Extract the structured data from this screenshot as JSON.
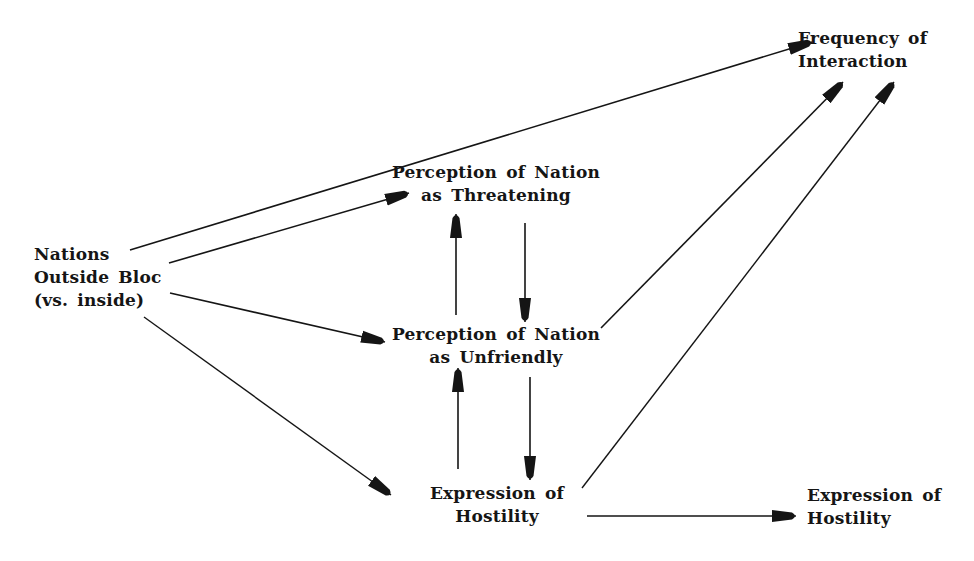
{
  "diagram": {
    "type": "causal-path-diagram",
    "nodes": [
      {
        "id": "nations_outside_bloc",
        "lines": [
          "Nations",
          "Outside Bloc",
          "(vs. inside)"
        ]
      },
      {
        "id": "perception_threatening",
        "lines": [
          "Perception of Nation",
          "as Threatening"
        ]
      },
      {
        "id": "perception_unfriendly",
        "lines": [
          "Perception of Nation",
          "as Unfriendly"
        ]
      },
      {
        "id": "expression_hostility_mid",
        "lines": [
          "Expression of",
          "Hostility"
        ]
      },
      {
        "id": "frequency_interaction",
        "lines": [
          "Frequency of",
          "Interaction"
        ]
      },
      {
        "id": "expression_hostility_right",
        "lines": [
          "Expression of",
          "Hostility"
        ]
      }
    ],
    "edges": [
      {
        "from": "nations_outside_bloc",
        "to": "frequency_interaction"
      },
      {
        "from": "nations_outside_bloc",
        "to": "perception_threatening"
      },
      {
        "from": "nations_outside_bloc",
        "to": "perception_unfriendly"
      },
      {
        "from": "nations_outside_bloc",
        "to": "expression_hostility_mid"
      },
      {
        "from": "perception_unfriendly",
        "to": "perception_threatening"
      },
      {
        "from": "perception_threatening",
        "to": "perception_unfriendly"
      },
      {
        "from": "expression_hostility_mid",
        "to": "perception_unfriendly"
      },
      {
        "from": "perception_unfriendly",
        "to": "expression_hostility_mid"
      },
      {
        "from": "perception_unfriendly",
        "to": "frequency_interaction"
      },
      {
        "from": "expression_hostility_mid",
        "to": "frequency_interaction"
      },
      {
        "from": "expression_hostility_mid",
        "to": "expression_hostility_right"
      }
    ],
    "colors": {
      "ink": "#151515",
      "background": "#ffffff"
    }
  }
}
